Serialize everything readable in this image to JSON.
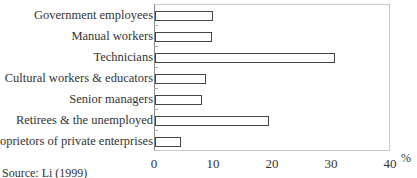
{
  "chart_data": {
    "type": "bar",
    "orientation": "horizontal",
    "title": "",
    "xlabel": "%",
    "ylabel": "",
    "categories": [
      "Government employees",
      "Manual workers",
      "Technicians",
      "Cultural workers & educators",
      "Senior managers",
      "Retirees & the unemployed",
      "Proprietors of private enterprises"
    ],
    "values": [
      9.8,
      9.6,
      30.5,
      8.6,
      8.0,
      19.3,
      4.4
    ],
    "xlim": [
      0,
      40
    ],
    "xticks": [
      "0",
      "10",
      "20",
      "30",
      "40"
    ],
    "grid": false,
    "legend": null,
    "bar_fill": "#ffffff",
    "bar_edge": "#444444",
    "source": "Source: Li (1999)"
  }
}
